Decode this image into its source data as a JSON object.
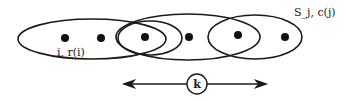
{
  "diagram": {
    "labels": {
      "element": "i, r(i)",
      "set": "S_j, c(j)",
      "distance": "k"
    },
    "colors": {
      "stroke": "#1a1a1a",
      "background": "#ffffff"
    },
    "sets": [
      {
        "name": "set-left",
        "cx": 92,
        "cy": 39,
        "rx": 74,
        "ry": 20
      },
      {
        "name": "set-middle",
        "cx": 188,
        "cy": 37,
        "rx": 72,
        "ry": 23
      },
      {
        "name": "set-small-left",
        "cx": 150,
        "cy": 39,
        "rx": 32,
        "ry": 16
      },
      {
        "name": "set-right",
        "cx": 255,
        "cy": 37,
        "rx": 47,
        "ry": 22
      }
    ],
    "elements": [
      {
        "x": 65,
        "y": 38
      },
      {
        "x": 101,
        "y": 38
      },
      {
        "x": 145,
        "y": 37
      },
      {
        "x": 189,
        "y": 37
      },
      {
        "x": 238,
        "y": 35
      },
      {
        "x": 285,
        "y": 37
      }
    ],
    "arrow": {
      "x1": 123,
      "x2": 266,
      "y": 84,
      "circle_x": 197,
      "circle_r": 10
    }
  }
}
